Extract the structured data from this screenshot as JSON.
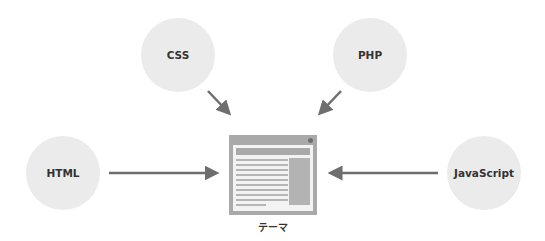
{
  "diagram": {
    "nodes": [
      {
        "id": "css",
        "label": "CSS"
      },
      {
        "id": "php",
        "label": "PHP"
      },
      {
        "id": "html",
        "label": "HTML"
      },
      {
        "id": "javascript",
        "label": "JavaScript"
      }
    ],
    "center": {
      "label": "テーマ",
      "icon": "browser-window-icon"
    },
    "edges": [
      {
        "from": "css",
        "to": "theme"
      },
      {
        "from": "php",
        "to": "theme"
      },
      {
        "from": "html",
        "to": "theme"
      },
      {
        "from": "javascript",
        "to": "theme"
      }
    ],
    "colors": {
      "circle": "#ebebeb",
      "arrow": "#6e6e6e",
      "window": "#a9a9a9",
      "text": "#333333"
    }
  }
}
